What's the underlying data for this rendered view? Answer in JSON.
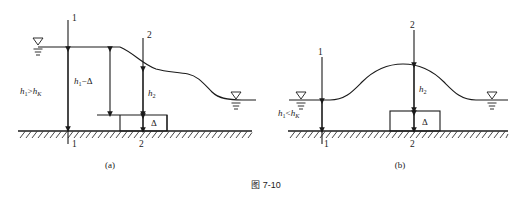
{
  "figure": {
    "caption": "图 7-10",
    "panels": [
      {
        "id": "a",
        "label": "(a)",
        "section_top_1": "1",
        "section_top_2": "2",
        "section_bottom_1": "1",
        "section_bottom_2": "2",
        "depth_upstream": {
          "base": "h",
          "sub": "1",
          "relation": ">",
          "base2": "h",
          "sub2": "K"
        },
        "dim_h1_minus_delta": {
          "base": "h",
          "sub": "1",
          "tail": "−Δ"
        },
        "dim_h2": {
          "base": "h",
          "sub": "2"
        },
        "dim_delta": "Δ"
      },
      {
        "id": "b",
        "label": "(b)",
        "section_top_1": "1",
        "section_top_2": "2",
        "section_bottom_1": "1",
        "section_bottom_2": "2",
        "depth_upstream": {
          "base": "h",
          "sub": "1",
          "relation": "<",
          "base2": "h",
          "sub2": "K"
        },
        "dim_h2": {
          "base": "h",
          "sub": "2"
        },
        "dim_delta": "Δ"
      }
    ],
    "symbols": {
      "water-surface-marker": "free-surface-triangle",
      "ground-hatch": "hatched-bed-line",
      "dimension-arrow": "double-headed-arrow"
    },
    "colors": {
      "line": "#1a1a1a",
      "background": "#ffffff",
      "text": "#1a1a1a"
    }
  }
}
